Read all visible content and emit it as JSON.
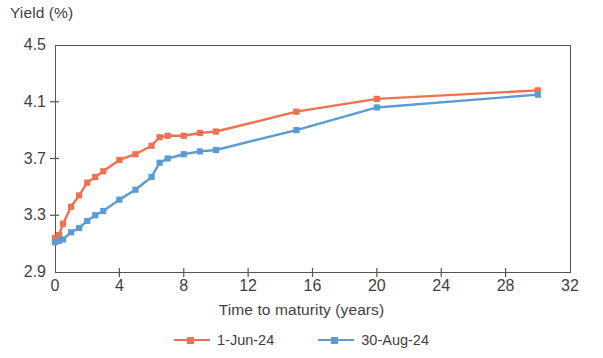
{
  "chart_data": {
    "type": "line",
    "title": "",
    "xlabel": "Time to maturity (years)",
    "ylabel": "Yield (%)",
    "xlim": [
      0,
      32
    ],
    "ylim": [
      2.9,
      4.5
    ],
    "xticks": [
      0,
      4,
      8,
      12,
      16,
      20,
      24,
      28,
      32
    ],
    "xtick_labels": [
      "0",
      "4",
      "8",
      "12",
      "16",
      "20",
      "24",
      "28",
      "32"
    ],
    "yticks": [
      2.9,
      3.3,
      3.7,
      4.1,
      4.5
    ],
    "ytick_labels": [
      "2.9",
      "3.3",
      "3.7",
      "4.1",
      "4.5"
    ],
    "grid": false,
    "legend_position": "bottom-center",
    "series": [
      {
        "name": "1-Jun-24",
        "color": "#ee7150",
        "marker": "square",
        "x": [
          0,
          0.25,
          0.5,
          1,
          1.5,
          2,
          2.5,
          3,
          4,
          5,
          6,
          6.5,
          7,
          8,
          9,
          10,
          15,
          20,
          30
        ],
        "values": [
          3.14,
          3.16,
          3.24,
          3.36,
          3.44,
          3.53,
          3.57,
          3.61,
          3.69,
          3.73,
          3.79,
          3.85,
          3.86,
          3.86,
          3.88,
          3.89,
          4.03,
          4.12,
          4.18
        ]
      },
      {
        "name": "30-Aug-24",
        "color": "#5b9bd5",
        "marker": "square",
        "x": [
          0,
          0.25,
          0.5,
          1,
          1.5,
          2,
          2.5,
          3,
          4,
          5,
          6,
          6.5,
          7,
          8,
          9,
          10,
          15,
          20,
          30
        ],
        "values": [
          3.11,
          3.12,
          3.13,
          3.18,
          3.21,
          3.26,
          3.3,
          3.33,
          3.41,
          3.48,
          3.57,
          3.67,
          3.7,
          3.73,
          3.75,
          3.76,
          3.9,
          4.06,
          4.15
        ]
      }
    ]
  },
  "axes": {
    "y_title": "Yield (%)",
    "x_title": "Time to maturity (years)"
  },
  "legend": {
    "items": [
      {
        "label": "1-Jun-24",
        "color": "#ee7150"
      },
      {
        "label": "30-Aug-24",
        "color": "#5b9bd5"
      }
    ]
  },
  "plot_box": {
    "left": 55,
    "right": 570,
    "top": 45,
    "bottom": 272
  }
}
